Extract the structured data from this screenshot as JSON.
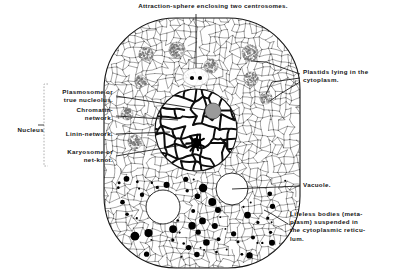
{
  "figure": {
    "background_color": "#ffffff",
    "ink_color": "#141414"
  },
  "labels": {
    "attraction_sphere": "Attraction-sphere enclosing two centrosomes.",
    "plastids": "Plastids lying in the\ncytoplasm.",
    "vacuole": "Vacuole.",
    "lifeless_bodies": "Lifeless bodies (meta-\nplasm) suspended in\nthe cytoplasmic reticu-\nlum.",
    "nucleus_bracket": "Nucleus",
    "plasmosome": "Plasmosome or\ntrue nucleolus.",
    "chromatin": "Chromatin-\nnetwork.",
    "linin": "Linin-network.",
    "karyosome": "Karyosome or\nnet-knot."
  },
  "cell": {
    "outline": {
      "x": 104,
      "y": 18,
      "width": 196,
      "height": 250,
      "corner_radius": 72,
      "stroke": "#141414",
      "fill": "#ffffff"
    },
    "nucleus": {
      "cx": 196,
      "cy": 130,
      "r": 41,
      "stroke": "#141414"
    },
    "plasmosome": {
      "cx": 213,
      "cy": 111,
      "r": 8,
      "fill": "#9a9a9a"
    },
    "karyosome": {
      "cx": 196,
      "cy": 143,
      "r": 5,
      "fill": "#000000"
    },
    "attraction_sphere": {
      "cx": 196,
      "cy": 77,
      "rx": 13,
      "ry": 9,
      "centrosomes": [
        {
          "cx": 192,
          "cy": 78,
          "r": 2.1
        },
        {
          "cx": 200,
          "cy": 78,
          "r": 2.1
        }
      ]
    },
    "vacuoles": [
      {
        "cx": 163,
        "cy": 207,
        "r": 17
      },
      {
        "cx": 232,
        "cy": 189,
        "r": 16
      }
    ],
    "plastids": [
      {
        "cx": 146,
        "cy": 54,
        "r": 7
      },
      {
        "cx": 177,
        "cy": 50,
        "r": 8
      },
      {
        "cx": 250,
        "cy": 53,
        "r": 8
      },
      {
        "cx": 211,
        "cy": 66,
        "r": 7
      },
      {
        "cx": 141,
        "cy": 81,
        "r": 6
      },
      {
        "cx": 251,
        "cy": 79,
        "r": 7
      },
      {
        "cx": 266,
        "cy": 98,
        "r": 6
      },
      {
        "cx": 127,
        "cy": 114,
        "r": 6
      },
      {
        "cx": 135,
        "cy": 142,
        "r": 7
      }
    ],
    "lifeless_bodies_count": 62
  },
  "leaders": {
    "attraction_sphere": [
      [
        196,
        14
      ],
      [
        196,
        68
      ]
    ],
    "plastids": [
      [
        [
          300,
          74
        ],
        [
          266,
          62
        ],
        [
          251,
          61
        ]
      ],
      [
        [
          300,
          78
        ],
        [
          272,
          82
        ],
        [
          266,
          94
        ]
      ],
      [
        [
          300,
          82
        ],
        [
          280,
          94
        ],
        [
          270,
          101
        ]
      ]
    ],
    "vacuole": [
      [
        300,
        186
      ],
      [
        232,
        189
      ]
    ],
    "lifeless": [
      [
        288,
        224
      ],
      [
        272,
        214
      ],
      [
        264,
        210
      ]
    ],
    "plasmosome": [
      [
        116,
        96
      ],
      [
        205,
        110
      ]
    ],
    "chromatin": [
      [
        116,
        116
      ],
      [
        178,
        120
      ]
    ],
    "linin": [
      [
        116,
        134
      ],
      [
        170,
        132
      ]
    ],
    "karyosome": [
      [
        116,
        156
      ],
      [
        194,
        143
      ]
    ],
    "nucleus_bracket": {
      "x": 44,
      "top": 84,
      "bottom": 166,
      "tick": 4
    }
  }
}
